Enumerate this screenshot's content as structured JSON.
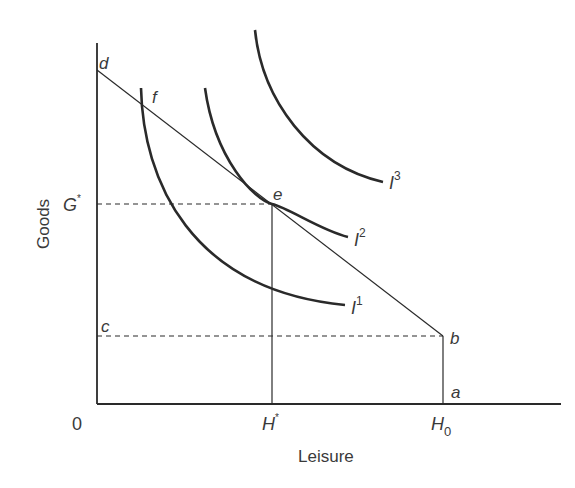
{
  "diagram": {
    "type": "labor-leisure indifference diagram",
    "axes": {
      "x_label": "Leisure",
      "y_label": "Goods",
      "origin": "0"
    },
    "points": {
      "d": "d",
      "f": "f",
      "e": "e",
      "b": "b",
      "a": "a",
      "c": "c"
    },
    "ticks": {
      "g_star": "G",
      "g_star_sup": "*",
      "h_star": "H",
      "h_star_sup": "*",
      "h0": "H",
      "h0_sub": "0"
    },
    "curves": [
      {
        "name": "I",
        "sup": "1"
      },
      {
        "name": "I",
        "sup": "2"
      },
      {
        "name": "I",
        "sup": "3"
      }
    ],
    "colors": {
      "line": "#2a2a2a",
      "text": "#3a3a3a"
    }
  }
}
